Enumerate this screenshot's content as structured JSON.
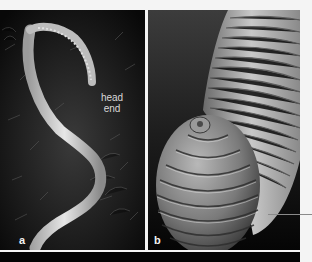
{
  "figure": {
    "panels": [
      {
        "id": "a",
        "label": "a",
        "description": "whole worm on mossy substrate",
        "annotation": {
          "line1": "head",
          "line2": "end"
        }
      },
      {
        "id": "b",
        "label": "b",
        "description": "scanning electron micrograph of coiled segmented worm end"
      }
    ],
    "colors": {
      "background": "#f4f4f4",
      "panel_dark": "#0a0a0a",
      "band": "#030303",
      "pointer": "#8a8a8a",
      "label_text": "#f2f2f2"
    }
  }
}
